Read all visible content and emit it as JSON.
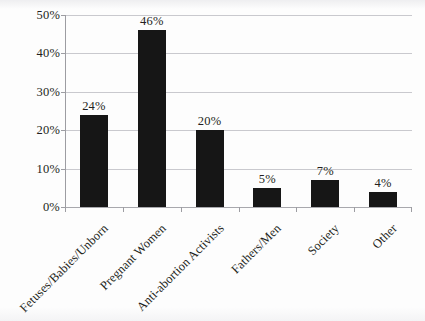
{
  "chart_data": {
    "type": "bar",
    "title": "",
    "subtitle": "",
    "xlabel": "",
    "ylabel": "",
    "categories": [
      "Fetuses/Babies/Unborn",
      "Pregnant Women",
      "Anti-abortion Activists",
      "Fathers/Men",
      "Society",
      "Other"
    ],
    "values": [
      24,
      46,
      20,
      5,
      7,
      4
    ],
    "value_labels": [
      "24%",
      "46%",
      "20%",
      "5%",
      "7%",
      "4%"
    ],
    "ylim": [
      0,
      50
    ],
    "ytick_values": [
      0,
      10,
      20,
      30,
      40,
      50
    ],
    "ytick_labels": [
      "0%",
      "10%",
      "20%",
      "30%",
      "40%",
      "50%"
    ],
    "grid": true,
    "legend": false,
    "legend_position": "none",
    "bar_color": "#161616",
    "gridline_color": "#c9c9ce",
    "axis_color": "#9d9da2",
    "background_color": "#fdfdfd",
    "text_color": "#231f20",
    "x_label_rotation": -45
  }
}
